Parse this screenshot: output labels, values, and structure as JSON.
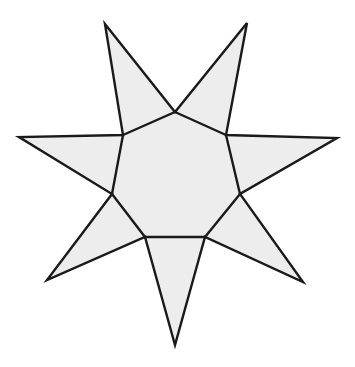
{
  "figure": {
    "title": "Seven-pointed star (heptagram) outline figure",
    "kind": "geometric-line-drawing",
    "canvas": {
      "width": 355,
      "height": 367,
      "background_color": "#ffffff"
    },
    "style": {
      "fill_color": "#ededed",
      "stroke_color": "#1a1a1a",
      "stroke_width": 2.4,
      "stroke_linejoin": "miter",
      "stroke_linecap": "round"
    },
    "shape": {
      "name": "heptagram",
      "point_count": 7,
      "has_visible_inner_polygon": true,
      "inner_polygon_name": "heptagon",
      "center": {
        "x": 176,
        "y": 178
      },
      "outer_radius_approx": 168,
      "inner_radius_approx": 66
    },
    "outer_points": [
      {
        "label": "top-left-point",
        "x": 105,
        "y": 24
      },
      {
        "label": "top-right-point",
        "x": 247,
        "y": 23
      },
      {
        "label": "right-point",
        "x": 337,
        "y": 138
      },
      {
        "label": "bottom-right-point",
        "x": 303,
        "y": 282
      },
      {
        "label": "bottom-point",
        "x": 175,
        "y": 345
      },
      {
        "label": "bottom-left-point",
        "x": 47,
        "y": 280
      },
      {
        "label": "left-point",
        "x": 19,
        "y": 137
      }
    ],
    "inner_points": [
      {
        "label": "inner-top",
        "x": 175,
        "y": 112
      },
      {
        "label": "inner-upper-right",
        "x": 226,
        "y": 135
      },
      {
        "label": "inner-right",
        "x": 240,
        "y": 194
      },
      {
        "label": "inner-lower-right",
        "x": 205,
        "y": 237
      },
      {
        "label": "inner-lower-left",
        "x": 145,
        "y": 237
      },
      {
        "label": "inner-left",
        "x": 112,
        "y": 194
      },
      {
        "label": "inner-upper-left",
        "x": 123,
        "y": 135
      }
    ],
    "star_outline_path": "M 105 24 L 175 112 L 247 23 L 226 135 L 337 138 L 240 194 L 303 282 L 205 237 L 175 345 L 145 237 L 47 280 L 112 194 L 19 137 L 123 135 Z",
    "inner_polygon_path": "M 175 112 L 226 135 L 240 194 L 205 237 L 145 237 L 112 194 L 123 135 Z"
  }
}
